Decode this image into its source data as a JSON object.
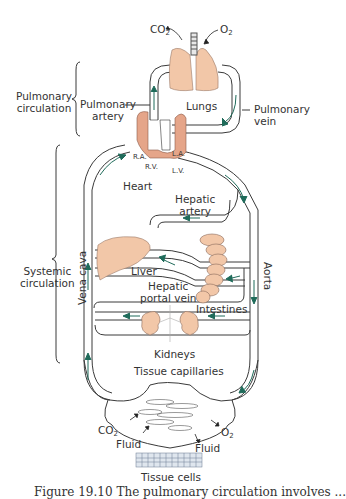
{
  "diagram": {
    "colors": {
      "organ_fill": "#f2c7a8",
      "heart_wall": "#e5a589",
      "vessel_stroke": "#3a3a3a",
      "flow_arrow": "#1f6b5a",
      "text": "#333333"
    },
    "labels": {
      "co2_top": "CO",
      "co2_top_sub": "2",
      "o2_top": "O",
      "o2_top_sub": "2",
      "lungs": "Lungs",
      "pulmonary_circulation_1": "Pulmonary",
      "pulmonary_circulation_2": "circulation",
      "pulmonary_artery_1": "Pulmonary",
      "pulmonary_artery_2": "artery",
      "pulmonary_vein_1": "Pulmonary",
      "pulmonary_vein_2": "vein",
      "ra": "R.A.",
      "rv": "R.V.",
      "la": "L.A.",
      "lv": "L.V.",
      "heart": "Heart",
      "hepatic_artery_1": "Hepatic",
      "hepatic_artery_2": "artery",
      "systemic_circulation_1": "Systemic",
      "systemic_circulation_2": "circulation",
      "vena_cava": "Vena cava",
      "aorta": "Aorta",
      "liver": "Liver",
      "hepatic_portal_vein_1": "Hepatic",
      "hepatic_portal_vein_2": "portal vein",
      "intestines": "Intestines",
      "kidneys": "Kidneys",
      "tissue_capillaries": "Tissue capillaries",
      "co2_bottom": "CO",
      "co2_bottom_sub": "2",
      "o2_bottom": "O",
      "o2_bottom_sub": "2",
      "fluid_left": "Fluid",
      "fluid_right": "Fluid",
      "tissue_cells": "Tissue cells"
    },
    "caption": "Figure 19.10   The pulmonary circulation involves ..."
  }
}
